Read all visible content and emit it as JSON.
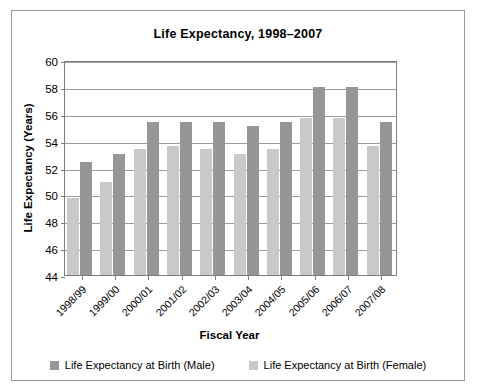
{
  "chart_data": {
    "type": "bar",
    "title": "Life Expectancy, 1998–2007",
    "xlabel": "Fiscal Year",
    "ylabel": "Life Expectancy (Years)",
    "ylim": [
      44,
      60
    ],
    "ytick_step": 2,
    "yticks": [
      "60",
      "58",
      "56",
      "54",
      "52",
      "50",
      "48",
      "46",
      "44"
    ],
    "grid": true,
    "legend_position": "bottom",
    "categories": [
      "1998/99",
      "1999/00",
      "2000/01",
      "2001/02",
      "2002/03",
      "2003/04",
      "2004/05",
      "2005/06",
      "2006/07",
      "2007/08"
    ],
    "series": [
      {
        "name": "Life Expectancy at Birth (Female)",
        "color": "#c9c9c9",
        "values": [
          49.7,
          50.9,
          53.4,
          53.6,
          53.4,
          53.0,
          53.4,
          55.7,
          55.7,
          53.6
        ]
      },
      {
        "name": "Life Expectancy at Birth (Male)",
        "color": "#969696",
        "values": [
          52.4,
          53.0,
          55.4,
          55.4,
          55.4,
          55.1,
          55.4,
          58.0,
          58.0,
          55.4
        ]
      }
    ]
  },
  "legend": [
    {
      "label": "Life Expectancy at Birth (Male)",
      "color": "#969696"
    },
    {
      "label": "Life Expectancy at Birth (Female)",
      "color": "#c9c9c9"
    }
  ]
}
